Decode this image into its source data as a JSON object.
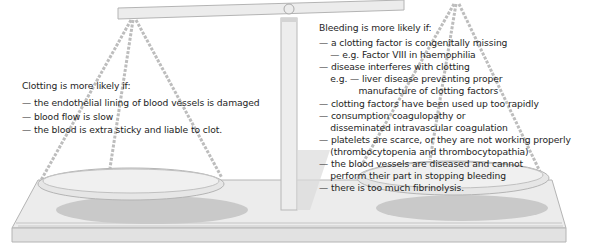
{
  "diagram": {
    "type": "balance-scale",
    "tilt": "left side lower (clotting) vs right side higher (bleeding)",
    "colors": {
      "scale_fill": "#ebebeb",
      "scale_stroke": "#b4b4b4",
      "shadow": "#c8c8c8",
      "chain": "#bdbdbd",
      "text": "#1e1e1e"
    }
  },
  "left_panel": {
    "heading": "Clotting is more likely if:",
    "items": [
      "— the endothelial lining of blood vessels is damaged",
      "— blood flow is slow",
      "— the blood is extra sticky and liable to clot."
    ]
  },
  "right_panel": {
    "heading": "Bleeding is more likely if:",
    "lines": [
      "— a clotting factor is congenitally missing",
      "    — e.g. Factor VIII in haemophilia",
      "— disease interferes with clotting",
      "    e.g. — liver disease preventing proper",
      "              manufacture of clotting factors",
      "— clotting factors have been used up too rapidly",
      "— consumption coagulopathy or",
      "    disseminated intravascular coagulation",
      "— platelets are scarce, or they are not working properly",
      "    (thrombocytopenia and thrombocytopathia)",
      "— the blood vessels are diseased and cannot",
      "    perform their part in stopping bleeding",
      "— there is too much fibrinolysis."
    ]
  }
}
